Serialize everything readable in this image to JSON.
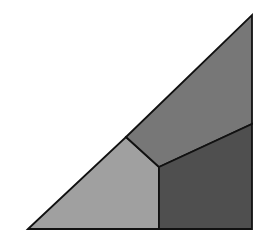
{
  "diagram": {
    "type": "partitioned-right-triangle",
    "canvas": {
      "width": 276,
      "height": 238,
      "background": "#ffffff"
    },
    "stroke": {
      "color": "#111111",
      "width": 1.8
    },
    "vertices": {
      "bottom_left": [
        28,
        229
      ],
      "top_right": [
        252,
        15
      ],
      "bottom_right": [
        252,
        229
      ],
      "hypotenuse_junction": [
        126,
        137
      ],
      "interior_junction": [
        159,
        167
      ],
      "right_edge_junction": [
        252,
        124
      ]
    },
    "regions": [
      {
        "id": "left-region",
        "fill": "#a0a0a0",
        "points": "28,229 126,137 159,167 159,229"
      },
      {
        "id": "top-region",
        "fill": "#777777",
        "points": "126,137 252,15 252,124 159,167"
      },
      {
        "id": "bottom-right-region",
        "fill": "#4f4f4f",
        "points": "159,167 252,124 252,229 159,229"
      }
    ]
  }
}
